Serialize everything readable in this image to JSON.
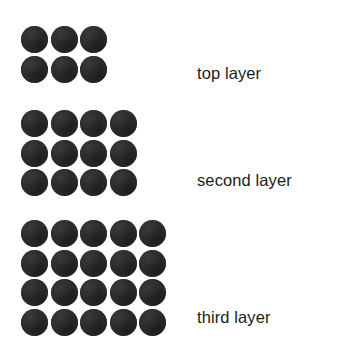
{
  "figure": {
    "background_color": "#ffffff",
    "sphere_color": "#2b2b2b",
    "text_color": "#1c1c1c"
  },
  "layers": [
    {
      "id": "top",
      "label": "top layer",
      "columns": 3,
      "rows": 2,
      "sphere_count": 6
    },
    {
      "id": "second",
      "label": "second layer",
      "columns": 4,
      "rows": 3,
      "sphere_count": 12
    },
    {
      "id": "third",
      "label": "third layer",
      "columns": 5,
      "rows": 4,
      "sphere_count": 20
    }
  ]
}
